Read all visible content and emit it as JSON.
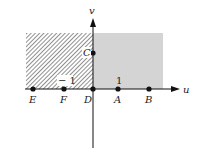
{
  "diagram": {
    "axes": {
      "horizontal_label": "u",
      "vertical_label": "v"
    },
    "regions": [
      {
        "name": "hatched-region",
        "style": "diagonal-hatch",
        "color": "#333333"
      },
      {
        "name": "gray-region",
        "style": "fill",
        "color": "#d4d4d4"
      }
    ],
    "points": [
      {
        "label": "E",
        "pos": "on u-axis, far left"
      },
      {
        "label": "F",
        "pos": "on u-axis at -1"
      },
      {
        "label": "D",
        "pos": "origin"
      },
      {
        "label": "A",
        "pos": "on u-axis at 1"
      },
      {
        "label": "B",
        "pos": "on u-axis, right"
      },
      {
        "label": "C",
        "pos": "on v-axis"
      }
    ],
    "tick_labels": {
      "neg_one": "− 1",
      "one": "1"
    }
  }
}
